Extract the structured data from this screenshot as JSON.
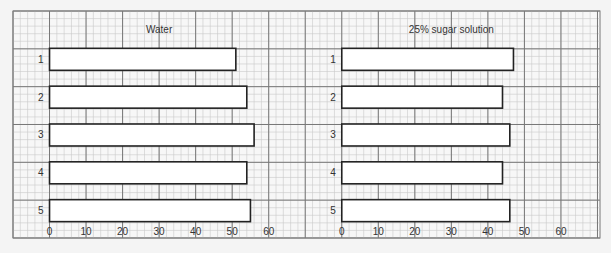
{
  "chart_data": [
    {
      "type": "bar",
      "orientation": "horizontal",
      "title": "Water",
      "categories": [
        "1",
        "2",
        "3",
        "4",
        "5"
      ],
      "values": [
        51,
        54,
        56,
        54,
        55
      ],
      "xlabel": "",
      "ylabel": "",
      "xlim": [
        0,
        60
      ],
      "xticks": [
        "0",
        "10",
        "20",
        "30",
        "40",
        "50",
        "60"
      ],
      "grid": true
    },
    {
      "type": "bar",
      "orientation": "horizontal",
      "title": "25% sugar solution",
      "categories": [
        "1",
        "2",
        "3",
        "4",
        "5"
      ],
      "values": [
        47,
        44,
        46,
        44,
        46
      ],
      "xlabel": "",
      "ylabel": "",
      "xlim": [
        0,
        60
      ],
      "xticks": [
        "0",
        "10",
        "20",
        "30",
        "40",
        "50",
        "60"
      ],
      "grid": true
    }
  ],
  "colors": {
    "paper": "#f7f7f7",
    "minor_grid": "#c9c9c9",
    "major_grid": "#777777",
    "bar_fill": "#ffffff",
    "bar_stroke": "#222222"
  }
}
